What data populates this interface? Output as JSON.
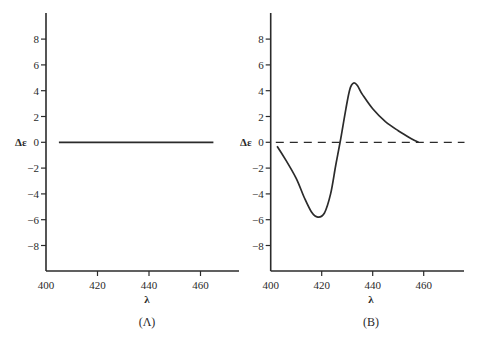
{
  "chart_data": [
    {
      "type": "line",
      "panel_label": "(Λ)",
      "title": "",
      "xlabel": "λ",
      "ylabel": "Δε",
      "xlim": [
        400,
        475
      ],
      "ylim": [
        -10,
        10
      ],
      "xticks": [
        400,
        420,
        440,
        460
      ],
      "yticks": [
        8,
        6,
        4,
        2,
        0,
        -2,
        -4,
        -6,
        -8
      ],
      "ytick_labels": [
        "8",
        "6",
        "4",
        "2",
        "0",
        "−2",
        "−4",
        "−6",
        "−8"
      ],
      "grid": false,
      "series": [
        {
          "name": "Δε (A)",
          "style": "solid",
          "x": [
            405,
            465
          ],
          "y": [
            0,
            0
          ]
        }
      ]
    },
    {
      "type": "line",
      "panel_label": "(B)",
      "title": "",
      "xlabel": "λ",
      "ylabel": "Δε",
      "xlim": [
        400,
        475
      ],
      "ylim": [
        -10,
        10
      ],
      "xticks": [
        400,
        420,
        440,
        460
      ],
      "yticks": [
        8,
        6,
        4,
        2,
        0,
        -2,
        -4,
        -6,
        -8
      ],
      "ytick_labels": [
        "8",
        "6",
        "4",
        "2",
        "0",
        "−2",
        "−4",
        "−6",
        "−8"
      ],
      "grid": false,
      "series": [
        {
          "name": "baseline",
          "style": "dashed",
          "x": [
            402,
            476
          ],
          "y": [
            0,
            0
          ]
        },
        {
          "name": "Δε (B)",
          "style": "solid",
          "x": [
            402.5,
            406,
            410,
            413,
            416,
            418.5,
            421,
            423.5,
            425.5,
            427.5,
            429.5,
            431,
            432.5,
            434,
            436,
            440,
            445,
            450,
            455,
            458
          ],
          "y": [
            -0.3,
            -1.4,
            -2.8,
            -4.2,
            -5.4,
            -5.8,
            -5.5,
            -4.0,
            -1.8,
            0.3,
            2.6,
            4.1,
            4.6,
            4.4,
            3.7,
            2.6,
            1.6,
            0.9,
            0.3,
            0.0
          ]
        }
      ]
    }
  ],
  "figure": {
    "panel_a": {
      "label": "(Λ)",
      "xlabel": "λ",
      "ylabel": "Δε"
    },
    "panel_b": {
      "label": "(B)",
      "xlabel": "λ",
      "ylabel": "Δε"
    }
  }
}
